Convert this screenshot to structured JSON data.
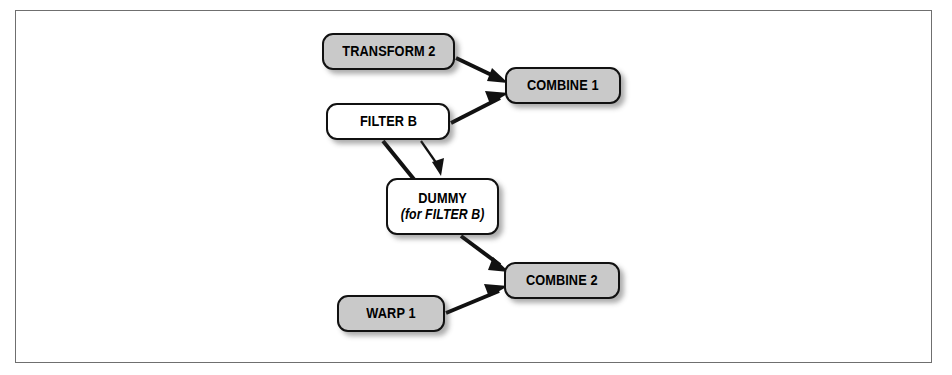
{
  "diagram": {
    "frame": {
      "visible": true,
      "border_color": "#6f6f6f"
    },
    "colors": {
      "node_gray_fill": "#c9c9c9",
      "node_white_fill": "#ffffff",
      "node_border": "#111111",
      "arrow": "#111111",
      "background": "#ffffff",
      "frame_border": "#6f6f6f"
    },
    "nodes": [
      {
        "id": "transform-2",
        "label": "TRANSFORM 2",
        "sublabel": "",
        "fill": "gray",
        "x": 322,
        "y": 33,
        "w": 133,
        "h": 37
      },
      {
        "id": "combine-1",
        "label": "COMBINE 1",
        "sublabel": "",
        "fill": "gray",
        "x": 505,
        "y": 67,
        "w": 116,
        "h": 37
      },
      {
        "id": "filter-b",
        "label": "FILTER B",
        "sublabel": "",
        "fill": "white",
        "x": 326,
        "y": 103,
        "w": 124,
        "h": 37
      },
      {
        "id": "dummy",
        "label": "DUMMY",
        "sublabel": "(for FILTER B)",
        "fill": "white",
        "x": 386,
        "y": 178,
        "w": 113,
        "h": 57
      },
      {
        "id": "combine-2",
        "label": "COMBINE 2",
        "sublabel": "",
        "fill": "gray",
        "x": 504,
        "y": 262,
        "w": 116,
        "h": 37
      },
      {
        "id": "warp-1",
        "label": "WARP 1",
        "sublabel": "",
        "fill": "gray",
        "x": 337,
        "y": 295,
        "w": 108,
        "h": 37
      }
    ],
    "edges": [
      {
        "id": "transform2-to-combine1",
        "from": "transform-2",
        "to": "combine-1",
        "weight": "thick",
        "arrowhead": true
      },
      {
        "id": "filterb-to-combine1",
        "from": "filter-b",
        "to": "combine-1",
        "weight": "thick",
        "arrowhead": true
      },
      {
        "id": "filterb-to-dummy-thick",
        "from": "filter-b",
        "to": "dummy",
        "weight": "thick",
        "arrowhead": false
      },
      {
        "id": "filterb-to-dummy-thin",
        "from": "filter-b",
        "to": "dummy",
        "weight": "thin",
        "arrowhead": true
      },
      {
        "id": "dummy-to-combine2",
        "from": "dummy",
        "to": "combine-2",
        "weight": "thick",
        "arrowhead": true
      },
      {
        "id": "warp1-to-combine2",
        "from": "warp-1",
        "to": "combine-2",
        "weight": "thick",
        "arrowhead": true
      }
    ]
  }
}
